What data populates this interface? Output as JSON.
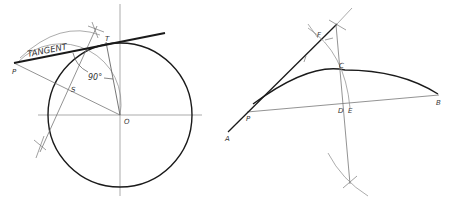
{
  "figure_left": {
    "labels": {
      "tangent": "TANGENT",
      "p": "P",
      "t": "T",
      "s": "S",
      "o": "O",
      "angle": "90°"
    }
  },
  "figure_right": {
    "labels": {
      "a": "A",
      "b": "B",
      "c": "C",
      "d": "D",
      "e": "E",
      "f": "F",
      "p": "P"
    }
  },
  "colors": {
    "heavy_line": "#1a1a1a",
    "light_line": "#7a7a7a",
    "background": "#ffffff"
  }
}
